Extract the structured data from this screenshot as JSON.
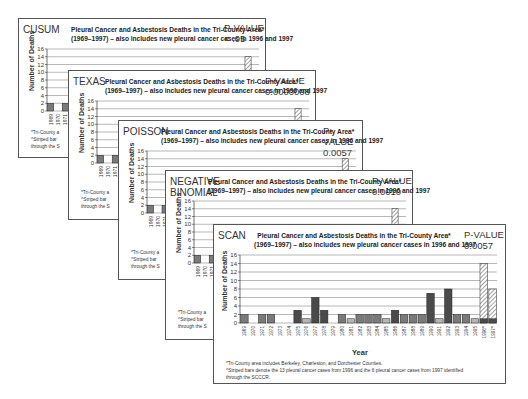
{
  "chart_title_line1": "Pleural Cancer and Asbestosis Deaths in the Tri-County Area*",
  "chart_title_line2": "(1969–1997) – also includes new pleural cancer cases in 1996 and 1997",
  "pvalue_label": "P-VALUE",
  "y_axis_label": "Number of Deaths",
  "x_axis_label": "Year",
  "footnote_1": "*Tri-County area includes Berkeley, Charleston, and Dorchester Counties.",
  "footnote_2": "^Striped bars denote the 13 pleural cancer cases from 1996 and the 6 pleural cancer cases from 1997 identified",
  "footnote_3": "through the SCCCR.",
  "footnote_short_1": "*Tri-County a",
  "footnote_short_2": "^Striped bar",
  "footnote_short_3": "through the S",
  "panels": [
    {
      "method": "CUSUM",
      "pvalue": "< .05"
    },
    {
      "method": "TEXAS",
      "pvalue": "0.0000008"
    },
    {
      "method": "POISSON",
      "pvalue": "0.0057"
    },
    {
      "method_line1": "NEGATIVE",
      "method_line2": "BINOMIAL",
      "pvalue": "0.0010"
    },
    {
      "method": "SCAN",
      "pvalue": "0.0057"
    }
  ],
  "colors": {
    "bar_dark": "#4a4a4a",
    "bar_mid": "#7a7a7a",
    "bar_light": "#b5b5b5",
    "grid": "#9a9a9a"
  },
  "chart_data": {
    "type": "bar",
    "title": "Pleural Cancer and Asbestosis Deaths in the Tri-County Area* (1969–1997) – also includes new pleural cancer cases in 1996 and 1997",
    "xlabel": "Year",
    "ylabel": "Number of Deaths",
    "ylim": [
      0,
      16
    ],
    "yticks": [
      0,
      2,
      4,
      6,
      8,
      10,
      12,
      14,
      16
    ],
    "grid": true,
    "categories": [
      "1969",
      "1970",
      "1971",
      "1972",
      "1973",
      "1974",
      "1975",
      "1976",
      "1977",
      "1978",
      "1979",
      "1980",
      "1981",
      "1982",
      "1983",
      "1984",
      "1985",
      "1986",
      "1987",
      "1988",
      "1989",
      "1990",
      "1991",
      "1992",
      "1993",
      "1994",
      "1995",
      "1996^",
      "1997^"
    ],
    "values": [
      2,
      0,
      2,
      2,
      0,
      0,
      3,
      1,
      6,
      3,
      0,
      2,
      1,
      2,
      2,
      2,
      1,
      3,
      2,
      2,
      2,
      7,
      1,
      8,
      2,
      2,
      1,
      14,
      8
    ],
    "striped_categories": [
      "1996^",
      "1997^"
    ],
    "panels": [
      "CUSUM",
      "TEXAS",
      "POISSON",
      "NEGATIVE BINOMIAL",
      "SCAN"
    ],
    "pvalues": {
      "CUSUM": "< .05",
      "TEXAS": "0.0000008",
      "POISSON": "0.0057",
      "NEGATIVE BINOMIAL": "0.0010",
      "SCAN": "0.0057"
    }
  }
}
